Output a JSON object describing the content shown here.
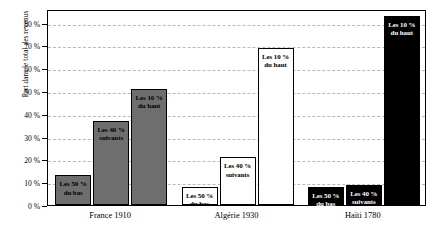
{
  "chart_data": {
    "type": "bar",
    "title": "",
    "subtitle": "",
    "xlabel": "",
    "ylabel": "Part dans le total des revenus",
    "ylim": [
      0,
      86
    ],
    "grid": true,
    "legend_position": "none",
    "yticks": [
      {
        "value": 0,
        "label": "0 %"
      },
      {
        "value": 10,
        "label": "10 %"
      },
      {
        "value": 20,
        "label": "20 %"
      },
      {
        "value": 30,
        "label": "30 %"
      },
      {
        "value": 40,
        "label": "40 %"
      },
      {
        "value": 50,
        "label": "50 %"
      },
      {
        "value": 60,
        "label": "60 %"
      },
      {
        "value": 70,
        "label": "70 %"
      },
      {
        "value": 80,
        "label": "80 %"
      }
    ],
    "categories": [
      "France 1910",
      "Algérie 1930",
      "Haïti 1780"
    ],
    "series": [
      {
        "name": "Les 50 %\ndu bas",
        "values": [
          13,
          8,
          8
        ]
      },
      {
        "name": "Les 40 %\nsuivants",
        "values": [
          37,
          21,
          9
        ]
      },
      {
        "name": "Les 10 %\ndu haut",
        "values": [
          51,
          69,
          83
        ]
      }
    ],
    "groups": [
      {
        "category": "France 1910",
        "fill": "gray",
        "bars": [
          {
            "label": "Les 50 %\ndu bas",
            "value": 13
          },
          {
            "label": "Les 40 %\nsuivants",
            "value": 37
          },
          {
            "label": "Les 10 %\ndu haut",
            "value": 51
          }
        ]
      },
      {
        "category": "Algérie 1930",
        "fill": "white",
        "bars": [
          {
            "label": "Les 50 %\ndu bas",
            "value": 8
          },
          {
            "label": "Les 40 %\nsuivants",
            "value": 21
          },
          {
            "label": "Les 10 %\ndu haut",
            "value": 69
          }
        ]
      },
      {
        "category": "Haïti 1780",
        "fill": "black",
        "bars": [
          {
            "label": "Les 50 %\ndu bas",
            "value": 8
          },
          {
            "label": "Les 40 %\nsuivants",
            "value": 9
          },
          {
            "label": "Les 10 %\ndu haut",
            "value": 83
          }
        ]
      }
    ]
  }
}
